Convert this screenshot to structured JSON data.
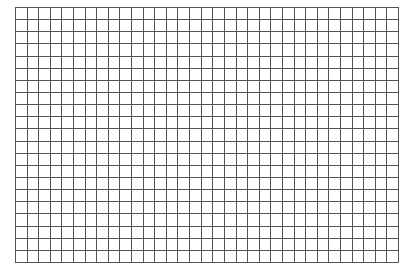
{
  "grid": {
    "columns": 33,
    "rows": 21,
    "left": 15,
    "top": 7,
    "width": 383,
    "height": 255,
    "line_color": "#555555",
    "background": "#ffffff"
  }
}
